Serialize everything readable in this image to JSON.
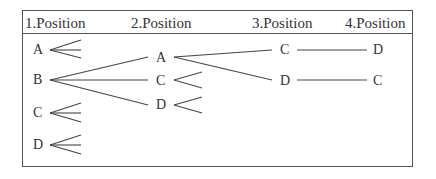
{
  "headers": [
    "1.Position",
    "2.Position",
    "3.Position",
    "4.Position"
  ],
  "tree": {
    "level1": [
      {
        "label": "A",
        "branches_open": true
      },
      {
        "label": "B",
        "children": [
          "A",
          "C",
          "D"
        ]
      },
      {
        "label": "C",
        "branches_open": true
      },
      {
        "label": "D",
        "branches_open": true
      }
    ],
    "level2": [
      {
        "label": "A",
        "parent": "B",
        "children": [
          "C",
          "D"
        ]
      },
      {
        "label": "C",
        "parent": "B",
        "branches_open": true
      },
      {
        "label": "D",
        "parent": "B",
        "branches_open": true
      }
    ],
    "level3": [
      {
        "label": "C",
        "parent": "B-A",
        "children": [
          "D"
        ]
      },
      {
        "label": "D",
        "parent": "B-A",
        "children": [
          "C"
        ]
      }
    ],
    "level4": [
      {
        "label": "D",
        "parent": "B-A-C"
      },
      {
        "label": "C",
        "parent": "B-A-D"
      }
    ]
  }
}
